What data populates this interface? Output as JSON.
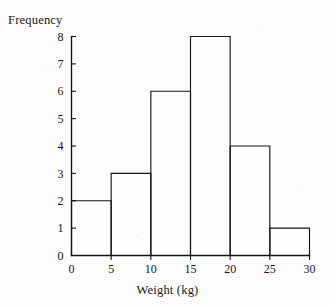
{
  "figure": {
    "background_color": "#fdfdfd",
    "ink_color": "#141414",
    "y_axis_title": "Frequency",
    "x_axis_title": "Weight (kg)"
  },
  "chart_data": {
    "type": "bar",
    "title": "",
    "subtitle": "",
    "xlabel": "Weight (kg)",
    "ylabel": "Frequency",
    "histogram": true,
    "bin_width": 5,
    "bin_edges": [
      0,
      5,
      10,
      15,
      20,
      25,
      30
    ],
    "categories": [
      "0-5",
      "5-10",
      "10-15",
      "15-20",
      "20-25",
      "25-30"
    ],
    "values": [
      2,
      3,
      6,
      8,
      4,
      1
    ],
    "bars": [
      {
        "bin_start": 0,
        "bin_end": 5,
        "frequency": 2
      },
      {
        "bin_start": 5,
        "bin_end": 10,
        "frequency": 3
      },
      {
        "bin_start": 10,
        "bin_end": 15,
        "frequency": 6
      },
      {
        "bin_start": 15,
        "bin_end": 20,
        "frequency": 8
      },
      {
        "bin_start": 20,
        "bin_end": 25,
        "frequency": 4
      },
      {
        "bin_start": 25,
        "bin_end": 30,
        "frequency": 1
      }
    ],
    "xlim": [
      0,
      30
    ],
    "ylim": [
      0,
      8
    ],
    "xticks": [
      0,
      5,
      10,
      15,
      20,
      25,
      30
    ],
    "yticks": [
      0,
      1,
      2,
      3,
      4,
      5,
      6,
      7,
      8
    ],
    "xtick_labels": [
      "0",
      "5",
      "10",
      "15",
      "20",
      "25",
      "30"
    ],
    "ytick_labels": [
      "0",
      "1",
      "2",
      "3",
      "4",
      "5",
      "6",
      "7",
      "8"
    ],
    "grid": false,
    "legend": null,
    "bar_fill": "none",
    "bar_edge_color": "#141414",
    "total_frequency": 24
  }
}
